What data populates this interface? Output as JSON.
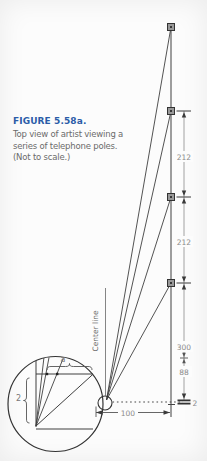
{
  "figure_caption": {
    "label": "FIGURE 5.58a.",
    "line1": "Top view of artist viewing a",
    "line2": "series of telephone poles.",
    "line3": "(Not to scale.)"
  },
  "diagram": {
    "center_line_label": "Center line",
    "pole_marker_icon": "square-pole-marker",
    "artist_marker_icon": "circle-artist-marker",
    "dims": {
      "gap_top": "212",
      "gap_mid": "212",
      "gap_lower": "300",
      "gap_near": "88",
      "near_offset": "2",
      "artist_to_poles": "100"
    },
    "inset": {
      "a_label": "a",
      "offset_label": "2"
    }
  },
  "colors": {
    "figure_label": "#2b5ca8",
    "caption_text": "#6b6b6b",
    "line": "#3f3f3f",
    "dim_text": "#8a8a8a",
    "pole_fill": "#999999"
  }
}
